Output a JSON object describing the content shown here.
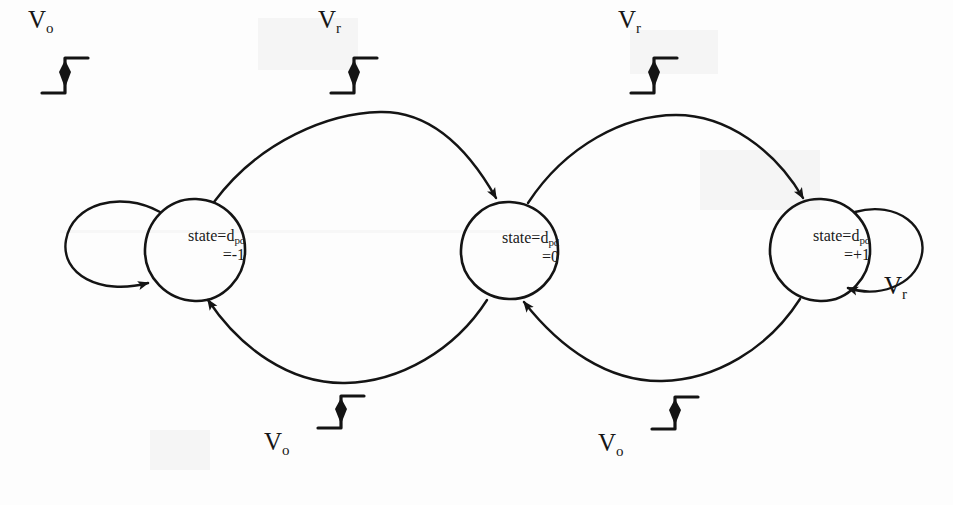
{
  "diagram": {
    "type": "state-machine",
    "stroke_color": "#141414",
    "background_color": "#fdfdfd",
    "states": [
      {
        "id": "state-minus-one",
        "line1": "state=d",
        "sub1": "pd",
        "line2": "=-1",
        "cx": 195,
        "cy": 250,
        "r": 50
      },
      {
        "id": "state-zero",
        "line1": "state=d",
        "sub1": "pd",
        "line2": "=0",
        "cx": 510,
        "cy": 250,
        "r": 48
      },
      {
        "id": "state-plus-one",
        "line1": "state=d",
        "sub1": "pd",
        "line2": "=+1",
        "cx": 820,
        "cy": 250,
        "r": 50
      }
    ],
    "transitions": [
      {
        "id": "loop-minus-one",
        "from": "state-minus-one",
        "to": "state-minus-one",
        "label": "V",
        "label_sub": "o",
        "has_step_icon": true,
        "kind": "self-loop-left"
      },
      {
        "id": "arc-minus-one-to-zero",
        "from": "state-minus-one",
        "to": "state-zero",
        "label": "V",
        "label_sub": "r",
        "has_step_icon": true,
        "kind": "arc-top"
      },
      {
        "id": "arc-zero-to-plus-one",
        "from": "state-zero",
        "to": "state-plus-one",
        "label": "V",
        "label_sub": "r",
        "has_step_icon": true,
        "kind": "arc-top"
      },
      {
        "id": "loop-plus-one",
        "from": "state-plus-one",
        "to": "state-plus-one",
        "label": "V",
        "label_sub": "r",
        "has_step_icon": false,
        "kind": "self-loop-right"
      },
      {
        "id": "arc-zero-to-minus-one",
        "from": "state-zero",
        "to": "state-minus-one",
        "label": "V",
        "label_sub": "o",
        "has_step_icon": true,
        "kind": "arc-bottom"
      },
      {
        "id": "arc-plus-one-to-zero",
        "from": "state-plus-one",
        "to": "state-zero",
        "label": "V",
        "label_sub": "o",
        "has_step_icon": true,
        "kind": "arc-bottom"
      }
    ],
    "labels": {
      "top_left": {
        "text": "V",
        "sub": "o"
      },
      "top_mid": {
        "text": "V",
        "sub": "r"
      },
      "top_right": {
        "text": "V",
        "sub": "r"
      },
      "bottom_left": {
        "text": "V",
        "sub": "o"
      },
      "bottom_right": {
        "text": "V",
        "sub": "o"
      },
      "right_loop": {
        "text": "V",
        "sub": "r"
      }
    }
  }
}
